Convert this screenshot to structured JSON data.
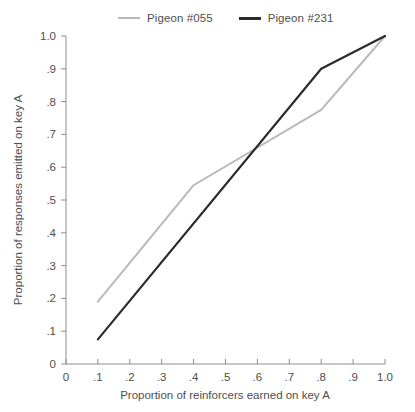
{
  "legend": {
    "position": "top-left",
    "entries": [
      {
        "label": "Pigeon #055",
        "color": "#b9b9b9",
        "icon": "line-swatch-gray"
      },
      {
        "label": "Pigeon #231",
        "color": "#2b2b2b",
        "icon": "line-swatch-dark"
      }
    ]
  },
  "chart_data": {
    "type": "line",
    "title": "",
    "xlabel": "Proportion of reinforcers earned on key A",
    "ylabel": "Proportion of responses emitted on key A",
    "xlim": [
      0,
      1.0
    ],
    "ylim": [
      0,
      1.0
    ],
    "grid": false,
    "legend_position": "top-left",
    "xticks": [
      0,
      0.1,
      0.2,
      0.3,
      0.4,
      0.5,
      0.6,
      0.7,
      0.8,
      0.9,
      1.0
    ],
    "xticklabels": [
      "0",
      ".1",
      ".2",
      ".3",
      ".4",
      ".5",
      ".6",
      ".7",
      ".8",
      ".9",
      "1.0"
    ],
    "yticks": [
      0,
      0.1,
      0.2,
      0.3,
      0.4,
      0.5,
      0.6,
      0.7,
      0.8,
      0.9,
      1.0
    ],
    "yticklabels": [
      "0",
      ".1",
      ".2",
      ".3",
      ".4",
      ".5",
      ".6",
      ".7",
      ".8",
      ".9",
      "1.0"
    ],
    "series": [
      {
        "name": "Pigeon #055",
        "color": "#b9b9b9",
        "width": 2,
        "x": [
          0.1,
          0.4,
          0.8,
          1.0
        ],
        "values": [
          0.19,
          0.545,
          0.775,
          1.0
        ]
      },
      {
        "name": "Pigeon #231",
        "color": "#2b2b2b",
        "width": 2.2,
        "x": [
          0.1,
          0.8,
          1.0
        ],
        "values": [
          0.075,
          0.9,
          1.0
        ]
      }
    ]
  }
}
